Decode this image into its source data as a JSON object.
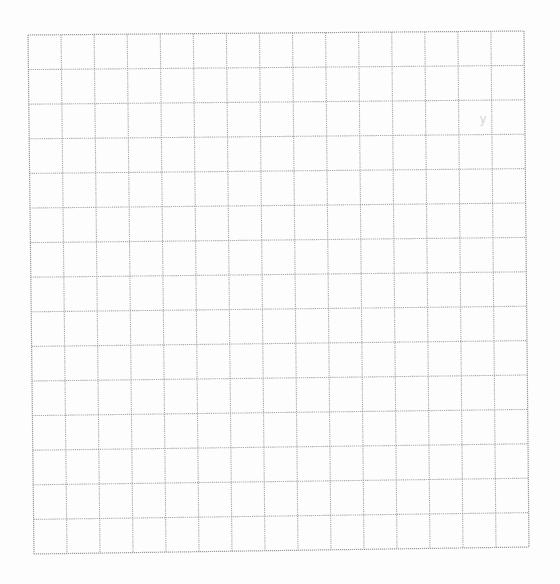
{
  "sheet": {
    "type": "grid-paper",
    "columns": 15,
    "rows": 15,
    "background": "#fdfdfd",
    "line_color": "#a9a9a9",
    "line_style": "dotted",
    "corners": {
      "top_left": [
        28,
        35
      ],
      "top_right": [
        524,
        31
      ],
      "bottom_left": [
        34,
        554
      ],
      "bottom_right": [
        529,
        547
      ]
    },
    "marks": [
      {
        "text": "y",
        "x": 480,
        "y": 112
      }
    ]
  }
}
